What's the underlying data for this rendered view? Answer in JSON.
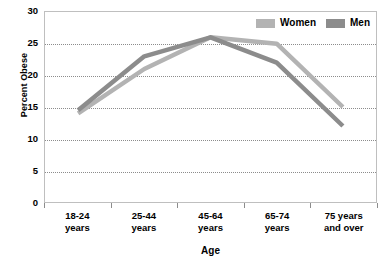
{
  "chart_data": {
    "type": "line",
    "title": "",
    "xlabel": "Age",
    "ylabel": "Percent Obese",
    "categories": [
      "18-24 years",
      "25-44 years",
      "45-64 years",
      "65-74 years",
      "75 years and over"
    ],
    "category_lines": [
      [
        "18-24",
        "years"
      ],
      [
        "25-44",
        "years"
      ],
      [
        "45-64",
        "years"
      ],
      [
        "65-74",
        "years"
      ],
      [
        "75 years",
        "and over"
      ]
    ],
    "series": [
      {
        "name": "Women",
        "color": "#b3b3b3",
        "values": [
          14,
          21,
          26,
          25,
          15
        ]
      },
      {
        "name": "Men",
        "color": "#8c8c8c",
        "values": [
          14.5,
          23,
          26,
          22,
          12
        ]
      }
    ],
    "ylim": [
      0,
      30
    ],
    "yticks": [
      0,
      5,
      10,
      15,
      20,
      25,
      30
    ],
    "ytick_labels": [
      "0",
      "5",
      "10",
      "15",
      "20",
      "25",
      "30"
    ],
    "grid": true,
    "grid_axis": "y",
    "legend_position": "top-right"
  },
  "legend": {
    "entries": [
      {
        "label": "Women"
      },
      {
        "label": "Men"
      }
    ]
  },
  "axes": {
    "y_title": "Percent Obese",
    "x_title": "Age"
  },
  "colors": {
    "women": "#b3b3b3",
    "men": "#8c8c8c",
    "frame": "#bfbfbf",
    "grid": "#8c8c8c",
    "background": "#ffffff",
    "text": "#000000"
  }
}
